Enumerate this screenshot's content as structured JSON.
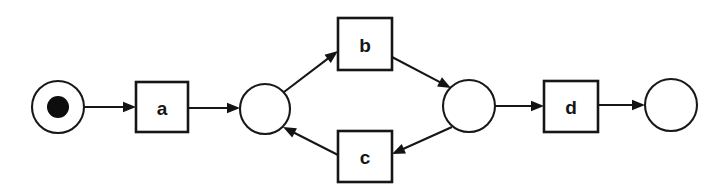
{
  "diagram": {
    "type": "petri-net",
    "width": 728,
    "height": 195,
    "background_color": "#ffffff",
    "stroke_color": "#161616",
    "token_color": "#0d0d0d",
    "places": [
      {
        "id": "p-start",
        "label": "",
        "cx": 58,
        "cy": 107,
        "r": 26,
        "tokens": 1,
        "token_r": 11,
        "name": "place-start"
      },
      {
        "id": "p-split",
        "label": "",
        "cx": 265,
        "cy": 109,
        "r": 25,
        "tokens": 0,
        "token_r": 0,
        "name": "place-split"
      },
      {
        "id": "p-join",
        "label": "",
        "cx": 469,
        "cy": 106,
        "r": 26,
        "tokens": 0,
        "token_r": 0,
        "name": "place-join"
      },
      {
        "id": "p-end",
        "label": "",
        "cx": 671,
        "cy": 105,
        "r": 26,
        "tokens": 0,
        "token_r": 0,
        "name": "place-end"
      }
    ],
    "transitions": [
      {
        "id": "t-a",
        "label": "a",
        "x": 136,
        "y": 82,
        "w": 52,
        "h": 50,
        "name": "transition-a"
      },
      {
        "id": "t-b",
        "label": "b",
        "x": 338,
        "y": 18,
        "w": 54,
        "h": 52,
        "name": "transition-b"
      },
      {
        "id": "t-c",
        "label": "c",
        "x": 338,
        "y": 131,
        "w": 54,
        "h": 51,
        "name": "transition-c"
      },
      {
        "id": "t-d",
        "label": "d",
        "x": 544,
        "y": 81,
        "w": 54,
        "h": 51,
        "name": "transition-d"
      }
    ],
    "arcs": [
      {
        "id": "arc-start-a",
        "from": "p-start",
        "to": "t-a",
        "x1": 85,
        "y1": 107,
        "x2": 136,
        "y2": 107,
        "name": "arc-place-start-to-a"
      },
      {
        "id": "arc-a-split",
        "from": "t-a",
        "to": "p-split",
        "x1": 188,
        "y1": 108,
        "x2": 240,
        "y2": 108,
        "name": "arc-a-to-place-split"
      },
      {
        "id": "arc-split-b",
        "from": "p-split",
        "to": "t-b",
        "x1": 284,
        "y1": 92,
        "x2": 338,
        "y2": 51,
        "name": "arc-place-split-to-b"
      },
      {
        "id": "arc-b-join",
        "from": "t-b",
        "to": "p-join",
        "x1": 392,
        "y1": 57,
        "x2": 451,
        "y2": 88,
        "name": "arc-b-to-place-join"
      },
      {
        "id": "arc-join-c",
        "from": "p-join",
        "to": "t-c",
        "x1": 452,
        "y1": 127,
        "x2": 392,
        "y2": 154,
        "name": "arc-place-join-to-c"
      },
      {
        "id": "arc-c-split",
        "from": "t-c",
        "to": "p-split",
        "x1": 338,
        "y1": 155,
        "x2": 283,
        "y2": 127,
        "name": "arc-c-to-place-split"
      },
      {
        "id": "arc-join-d",
        "from": "p-join",
        "to": "t-d",
        "x1": 495,
        "y1": 106,
        "x2": 544,
        "y2": 106,
        "name": "arc-place-join-to-d"
      },
      {
        "id": "arc-d-end",
        "from": "t-d",
        "to": "p-end",
        "x1": 598,
        "y1": 105,
        "x2": 645,
        "y2": 105,
        "name": "arc-d-to-place-end"
      }
    ]
  }
}
